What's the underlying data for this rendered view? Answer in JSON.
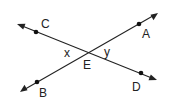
{
  "diagram": {
    "type": "intersecting-lines",
    "lines": [
      {
        "name": "line-CD",
        "from": [
          17,
          24
        ],
        "to": [
          157,
          80
        ],
        "points": [
          "C",
          "E",
          "D"
        ]
      },
      {
        "name": "line-AB",
        "from": [
          20,
          92
        ],
        "to": [
          158,
          13
        ],
        "points": [
          "B",
          "E",
          "A"
        ]
      }
    ],
    "points": {
      "C": {
        "label": "C",
        "x": 36,
        "y": 32,
        "label_x": 41,
        "label_y": 28
      },
      "A": {
        "label": "A",
        "x": 139,
        "y": 24,
        "label_x": 142,
        "label_y": 38
      },
      "B": {
        "label": "B",
        "x": 37,
        "y": 82,
        "label_x": 39,
        "label_y": 97
      },
      "D": {
        "label": "D",
        "x": 141,
        "y": 73,
        "label_x": 132,
        "label_y": 91
      },
      "E": {
        "label": "E",
        "x": 87,
        "y": 52,
        "label_x": 83,
        "label_y": 69
      }
    },
    "angles": {
      "x": {
        "label": "x",
        "label_x": 64,
        "label_y": 57
      },
      "y": {
        "label": "y",
        "label_x": 104,
        "label_y": 56
      }
    },
    "colors": {
      "line": "#222222",
      "background": "#ffffff"
    }
  }
}
